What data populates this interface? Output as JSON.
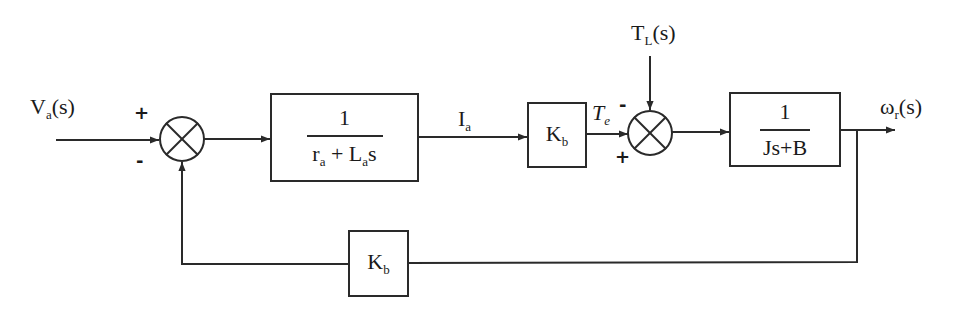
{
  "diagram": {
    "type": "block-diagram",
    "inputs": {
      "voltage": {
        "main": "V",
        "sub": "a",
        "arg": "(s)"
      },
      "load_torque": {
        "main": "T",
        "sub": "L",
        "arg": "(s)"
      }
    },
    "output": {
      "main": "ω",
      "sub": "r",
      "arg": "(s)"
    },
    "signals": {
      "armature_current": {
        "main": "I",
        "sub": "a"
      },
      "electric_torque": {
        "main": "T",
        "sub": "e"
      }
    },
    "summing_junctions": [
      {
        "id": "sum1",
        "top_sign": "+",
        "bottom_sign": "-"
      },
      {
        "id": "sum2",
        "top_sign": "-",
        "bottom_sign": "+"
      }
    ],
    "blocks": {
      "armature": {
        "numerator": "1",
        "den_a": "r",
        "den_a_sub": "a",
        "den_b": " + L",
        "den_b_sub": "a",
        "den_c": "s"
      },
      "torque_constant": {
        "main": "K",
        "sub": "b"
      },
      "mechanical": {
        "numerator": "1",
        "denominator": "Js+B"
      },
      "feedback": {
        "main": "K",
        "sub": "b"
      }
    },
    "line_color": "#2a2a2a"
  }
}
